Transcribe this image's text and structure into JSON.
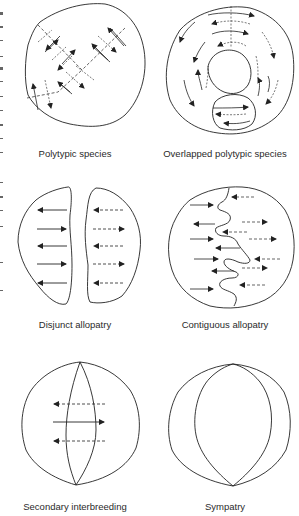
{
  "figure": {
    "panels": [
      {
        "id": "polytypic",
        "caption": "Polytypic species"
      },
      {
        "id": "overlapped",
        "caption": "Overlapped polytypic species"
      },
      {
        "id": "disjunct",
        "caption": "Disjunct allopatry"
      },
      {
        "id": "contiguous",
        "caption": "Contiguous allopatry"
      },
      {
        "id": "secondary",
        "caption": "Secondary interbreeding"
      },
      {
        "id": "sympatry",
        "caption": "Sympatry"
      }
    ],
    "colors": {
      "line": "#222222",
      "background": "#ffffff",
      "caption": "#2a2a2a"
    }
  }
}
